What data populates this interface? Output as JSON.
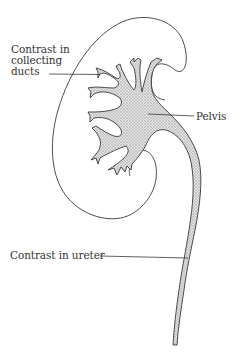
{
  "diagram": {
    "colors": {
      "outline": "#3a3a3a",
      "contrast_fill": "#d4d4d4",
      "background": "#ffffff",
      "text": "#333333"
    },
    "labels": {
      "collecting_ducts": {
        "lines": [
          "Contrast in",
          "collecting",
          "ducts"
        ]
      },
      "pelvis": "Pelvis",
      "ureter": "Contrast in ureter"
    }
  }
}
